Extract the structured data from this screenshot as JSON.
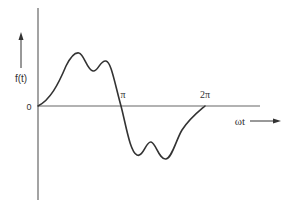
{
  "diagram": {
    "type": "waveform",
    "y_axis_label": "f(t)",
    "x_axis_label": "ωt",
    "origin_label": "0",
    "tick_labels": [
      "π",
      "2π"
    ],
    "colors": {
      "curve": "#333333",
      "axis": "#555555",
      "background": "#ffffff"
    }
  }
}
